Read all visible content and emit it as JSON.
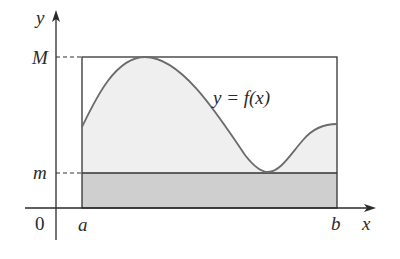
{
  "diagram": {
    "type": "extreme-value-area-bounds",
    "labels": {
      "y_axis": "y",
      "x_axis": "x",
      "origin": "0",
      "max_value": "M",
      "min_value": "m",
      "left_bound": "a",
      "right_bound": "b",
      "function": "y = f(x)"
    },
    "colors": {
      "axis": "#2a2a2a",
      "curve": "#6b6b6b",
      "light_fill": "#efefef",
      "dark_fill": "#cfcfcf",
      "rect_border": "#333333",
      "background": "#ffffff"
    },
    "geometry": {
      "y_axis_x": 56,
      "x_axis_y": 208,
      "a_x": 82,
      "b_x": 337,
      "M_y": 57,
      "m_y": 173
    }
  }
}
